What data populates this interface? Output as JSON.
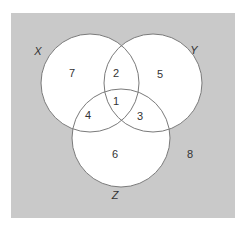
{
  "diagram": {
    "type": "venn",
    "colors": {
      "universe_fill": "#c9c9c9",
      "circle_fill": "#ffffff",
      "circle_stroke": "#7a7a7a",
      "text": "#333333"
    },
    "universe": {
      "x": 11,
      "y": 13,
      "width": 224,
      "height": 205
    },
    "sets": [
      {
        "name": "X",
        "cx": 90,
        "cy": 83,
        "r": 49,
        "label_x": 38,
        "label_y": 52
      },
      {
        "name": "Y",
        "cx": 153,
        "cy": 83,
        "r": 49,
        "label_x": 194,
        "label_y": 51
      },
      {
        "name": "Z",
        "cx": 121,
        "cy": 138,
        "r": 49,
        "label_x": 115,
        "label_y": 196
      }
    ],
    "regions": [
      {
        "id": "x_only",
        "value": "7",
        "x": 72,
        "y": 74
      },
      {
        "id": "x_and_y_only",
        "value": "2",
        "x": 116,
        "y": 74
      },
      {
        "id": "y_only",
        "value": "5",
        "x": 160,
        "y": 75
      },
      {
        "id": "x_y_z",
        "value": "1",
        "x": 116,
        "y": 102
      },
      {
        "id": "x_and_z_only",
        "value": "4",
        "x": 88,
        "y": 116
      },
      {
        "id": "y_and_z_only",
        "value": "3",
        "x": 140,
        "y": 117
      },
      {
        "id": "z_only",
        "value": "6",
        "x": 115,
        "y": 155
      },
      {
        "id": "outside",
        "value": "8",
        "x": 190,
        "y": 155
      }
    ]
  }
}
